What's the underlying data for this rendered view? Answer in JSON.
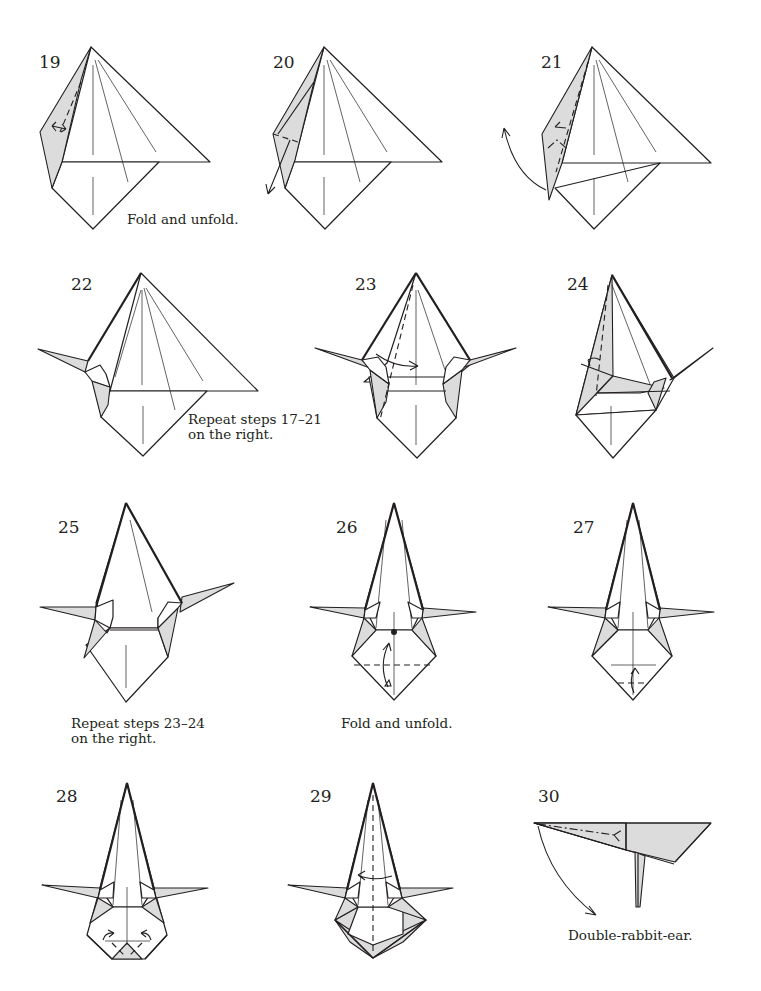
{
  "page": {
    "background": "#ffffff",
    "ink_color": "#231f20",
    "shade_color": "#dcdcdc"
  },
  "steps": [
    {
      "number": "19",
      "caption": "Fold and unfold.",
      "fold_marks": [
        "valley-fold-unfold",
        "fold-unfold-arrow"
      ]
    },
    {
      "number": "20",
      "caption": "",
      "fold_marks": [
        "valley-fold",
        "fold-arrow-down-left"
      ]
    },
    {
      "number": "21",
      "caption": "",
      "fold_marks": [
        "valley-fold",
        "mountain-fold",
        "swing-arrow"
      ]
    },
    {
      "number": "22",
      "caption": "Repeat steps 17–21 on the right.",
      "caption_lines": [
        "Repeat steps 17–21",
        "on the right."
      ],
      "fold_marks": []
    },
    {
      "number": "23",
      "caption": "",
      "fold_marks": [
        "valley-fold",
        "fold-arrow-right"
      ]
    },
    {
      "number": "24",
      "caption": "",
      "fold_marks": [
        "valley-fold",
        "fold-arrow-left"
      ]
    },
    {
      "number": "25",
      "caption": "Repeat steps 23–24 on the right.",
      "caption_lines": [
        "Repeat steps 23–24",
        "on the right."
      ],
      "fold_marks": []
    },
    {
      "number": "26",
      "caption": "Fold and unfold.",
      "fold_marks": [
        "reference-dot",
        "valley-fold-unfold",
        "fold-unfold-arrow"
      ]
    },
    {
      "number": "27",
      "caption": "",
      "fold_marks": [
        "valley-fold",
        "fold-arrow-up"
      ]
    },
    {
      "number": "28",
      "caption": "",
      "fold_marks": [
        "valley-fold",
        "fold-arrows-inward"
      ]
    },
    {
      "number": "29",
      "caption": "",
      "fold_marks": [
        "valley-fold",
        "turn-over-arrow"
      ]
    },
    {
      "number": "30",
      "caption": "Double-rabbit-ear.",
      "fold_marks": [
        "mountain-fold",
        "swing-arrow-down"
      ]
    }
  ]
}
